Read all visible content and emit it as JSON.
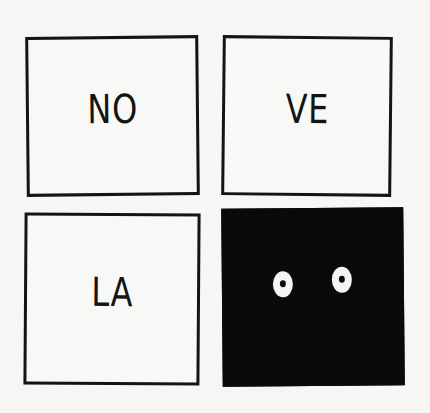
{
  "panels": [
    {
      "text": "NO",
      "fill": "white"
    },
    {
      "text": "VE",
      "fill": "white"
    },
    {
      "text": "LA",
      "fill": "white"
    },
    {
      "text": "",
      "fill": "black",
      "content": "two-eyes"
    }
  ],
  "colors": {
    "ink": "#141414",
    "paper": "#f6f6f4",
    "dark_panel": "#0a0a0a"
  }
}
